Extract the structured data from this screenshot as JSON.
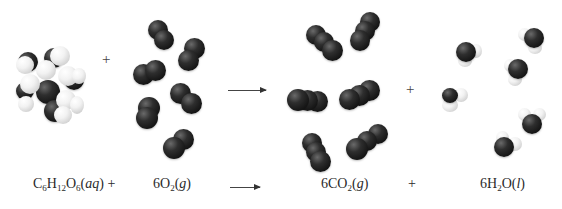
{
  "diagram": {
    "type": "chemical-reaction",
    "title": "",
    "operators": {
      "plus": "+",
      "arrow": "⟶"
    },
    "reactants": [
      {
        "formula_parts": [
          [
            "C",
            ""
          ],
          [
            "6",
            "sub"
          ],
          [
            "H",
            ""
          ],
          [
            "12",
            "sub"
          ],
          [
            "O",
            ""
          ],
          [
            "6",
            "sub"
          ],
          [
            "(",
            ""
          ],
          [
            "aq",
            "italic"
          ],
          [
            ") +",
            ""
          ]
        ],
        "formula_text": "C6H12O6(aq) +",
        "coefficient": "",
        "state": "aq",
        "molecule_count": 1,
        "model": "space-filling glucose"
      },
      {
        "formula_text": "6O2(g)",
        "coefficient": "6",
        "state": "g",
        "molecule_count": 6,
        "model": "space-filling O2"
      }
    ],
    "products": [
      {
        "formula_text": "6CO2(g)",
        "coefficient": "6",
        "state": "g",
        "molecule_count": 6,
        "model": "space-filling CO2"
      },
      {
        "formula_text": "6H2O(l)",
        "coefficient": "6",
        "state": "l",
        "molecule_count": 6,
        "model": "space-filling H2O"
      }
    ],
    "labels": {
      "glucose": {
        "pre": "C",
        "s1": "6",
        "m1": "H",
        "s2": "12",
        "m2": "O",
        "s3": "6",
        "open": "(",
        "state": "aq",
        "close": ") +"
      },
      "oxygen": {
        "coef": "6O",
        "s1": "2",
        "open": "(",
        "state": "g",
        "close": ")"
      },
      "co2": {
        "coef": "6CO",
        "s1": "2",
        "open": "(",
        "state": "g",
        "close": ")"
      },
      "plus_between_products": "+",
      "water": {
        "coef": "6H",
        "s1": "2",
        "m1": "O(",
        "state": "l",
        "close": ")"
      }
    },
    "colors": {
      "carbon_oxygen_atom": "#1a1a1a",
      "hydrogen_atom": "#f0f0f0",
      "text": "#2a2a2a",
      "background": "#ffffff"
    }
  }
}
